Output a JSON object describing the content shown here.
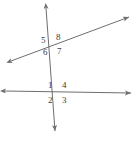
{
  "figure": {
    "type": "geometry-diagram",
    "background_color": "#ffffff",
    "line_color": "#6e6e6e",
    "label_color": "#3b3b3b",
    "width": 135,
    "height": 141
  },
  "lines": [
    {
      "name": "steep-line",
      "label": "near-vertical line",
      "x1": 46,
      "y1": 8,
      "x2": 55,
      "y2": 131,
      "arrow_start": true,
      "arrow_end": true
    },
    {
      "name": "transversal-line",
      "label": "rising transversal",
      "x1": 11,
      "y1": 61,
      "x2": 129,
      "y2": 17,
      "arrow_start": true,
      "arrow_end": true
    },
    {
      "name": "horizontal-line",
      "label": "horizontal line",
      "x1": 5,
      "y1": 91,
      "x2": 131,
      "y2": 93,
      "arrow_start": true,
      "arrow_end": true
    }
  ],
  "intersections": [
    {
      "name": "upper-intersection",
      "x": 52,
      "y": 44
    },
    {
      "name": "lower-intersection",
      "x": 59,
      "y": 92
    }
  ],
  "angle_labels": [
    {
      "id": "angle-5",
      "text": "5",
      "x": 41,
      "y": 36,
      "intersection": "upper-intersection",
      "position": "upper-left"
    },
    {
      "id": "angle-8",
      "text": "8",
      "x": 56,
      "y": 33,
      "intersection": "upper-intersection",
      "position": "upper-right"
    },
    {
      "id": "angle-6",
      "text": "6",
      "x": 43,
      "y": 48,
      "intersection": "upper-intersection",
      "position": "lower-left"
    },
    {
      "id": "angle-7",
      "text": "7",
      "x": 57,
      "y": 47,
      "intersection": "upper-intersection",
      "position": "lower-right"
    },
    {
      "id": "angle-1",
      "text": "1",
      "x": 48,
      "y": 81,
      "intersection": "lower-intersection",
      "position": "upper-left"
    },
    {
      "id": "angle-4",
      "text": "4",
      "x": 62,
      "y": 81,
      "intersection": "lower-intersection",
      "position": "upper-right"
    },
    {
      "id": "angle-2",
      "text": "2",
      "x": 48,
      "y": 96,
      "intersection": "lower-intersection",
      "position": "lower-left"
    },
    {
      "id": "angle-3",
      "text": "3",
      "x": 62,
      "y": 96,
      "intersection": "lower-intersection",
      "position": "lower-right"
    }
  ]
}
